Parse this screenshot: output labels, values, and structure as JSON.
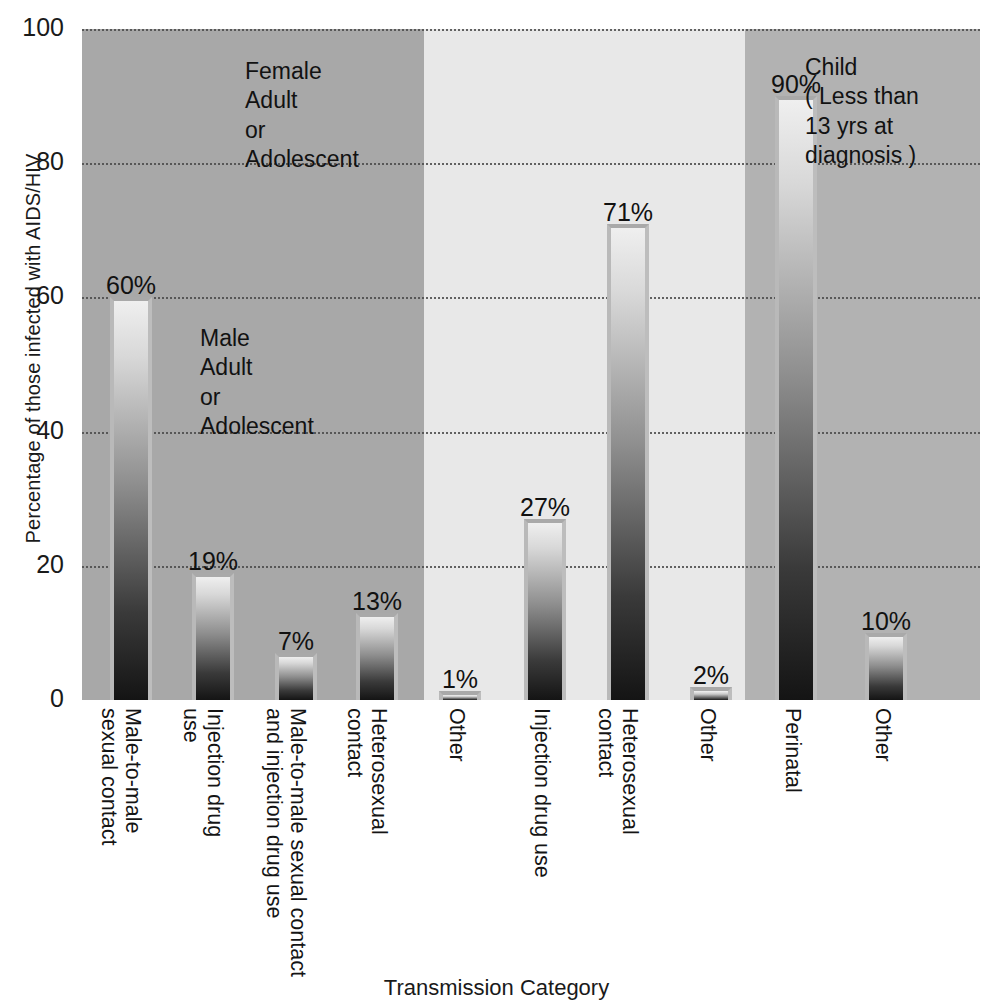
{
  "chart_data": {
    "type": "bar",
    "title": "",
    "xlabel": "Transmission Category",
    "ylabel": "Percentage of those infected with AIDS/HIV",
    "ylim": [
      0,
      100
    ],
    "yticks": [
      0,
      20,
      40,
      60,
      80,
      100
    ],
    "ytick_labels": [
      "0",
      "20",
      "40",
      "60",
      "80",
      "100"
    ],
    "grid": true,
    "legend": "none",
    "value_suffix": "%",
    "categories": [
      "Male-to-male sexual contact",
      "Injection drug use",
      "Male-to-male sexual contact and injection drug use",
      "Heterosexual contact",
      "Other",
      "Injection drug use",
      "Heterosexual contact",
      "Other",
      "Perinatal",
      "Other"
    ],
    "category_lines": [
      [
        "Male-to-male",
        "sexual contact"
      ],
      [
        "Injection drug",
        "use"
      ],
      [
        "Male-to-male sexual contact",
        "and injection drug use"
      ],
      [
        "Heterosexual",
        "contact"
      ],
      [
        "Other"
      ],
      [
        "Injection drug use"
      ],
      [
        "Heterosexual",
        "contact"
      ],
      [
        "Other"
      ],
      [
        "Perinatal"
      ],
      [
        "Other"
      ]
    ],
    "values": [
      60,
      19,
      7,
      13,
      1,
      27,
      71,
      2,
      90,
      10
    ],
    "value_labels": [
      "60%",
      "19%",
      "7%",
      "13%",
      "1%",
      "27%",
      "71%",
      "2%",
      "90%",
      "10%"
    ],
    "groups": [
      {
        "name": "Male Adult or Adolescent",
        "note_lines": "Male\nAdult\nor\nAdolescent",
        "bar_indices": [
          0,
          1,
          2,
          3
        ],
        "panel_color": "#a8a8a8"
      },
      {
        "name": "Female Adult or Adolescent",
        "note_lines": "Female\nAdult\nor\nAdolescent",
        "bar_indices": [
          4,
          5,
          6,
          7
        ],
        "panel_color": "#e8e8e8"
      },
      {
        "name": "Child ( Less than 13 yrs at diagnosis )",
        "note_lines": "Child\n( Less than\n13 yrs at\ndiagnosis )",
        "bar_indices": [
          8,
          9
        ],
        "panel_color": "#b2b2b2"
      }
    ],
    "colors": {
      "panel_1": "#a8a8a8",
      "panel_2": "#e8e8e8",
      "panel_3": "#b2b2b2",
      "gridline": "#4a4a4a",
      "text": "#141414",
      "bar_top": "#efefef",
      "bar_bottom": "#141414"
    }
  }
}
